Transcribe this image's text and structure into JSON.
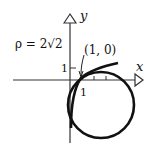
{
  "diagram": {
    "axes": {
      "x_label": "x",
      "y_label": "y",
      "x_tick_label": "1",
      "y_tick_label": "1"
    },
    "annotations": {
      "radius_of_curvature": "ρ = 2√2",
      "point_label": "(1, 0)"
    },
    "elements": [
      {
        "type": "curve",
        "description": "curve passing through (1, 0)"
      },
      {
        "type": "circle",
        "description": "circle of curvature tangent to curve at (1, 0)"
      }
    ],
    "colors": {
      "ink": "#111111",
      "background": "#ffffff"
    }
  }
}
